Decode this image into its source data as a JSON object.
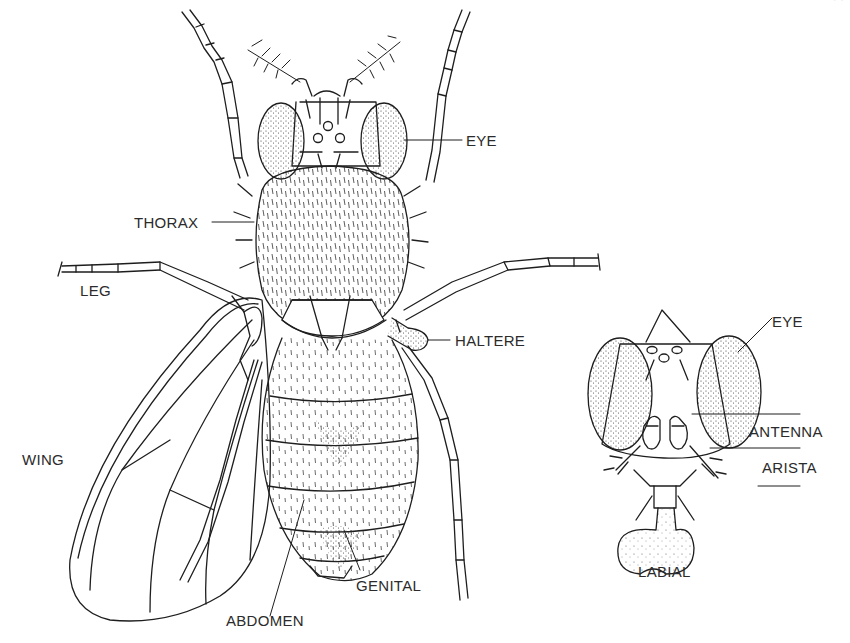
{
  "figure": {
    "page_number_partial": "· ·"
  },
  "dorsal_view": {
    "labels": {
      "eye": "EYE",
      "thorax": "THORAX",
      "leg": "LEG",
      "haltere": "HALTERE",
      "wing": "WING",
      "abdomen": "ABDOMEN",
      "genital": "GENITAL"
    }
  },
  "head_view": {
    "labels": {
      "eye": "EYE",
      "antenna": "ANTENNA",
      "arista": "ARISTA",
      "labial": "LABIAL"
    }
  },
  "colors": {
    "ink": "#1e1e1e",
    "label_text": "#2b2b2b",
    "background": "#ffffff"
  }
}
